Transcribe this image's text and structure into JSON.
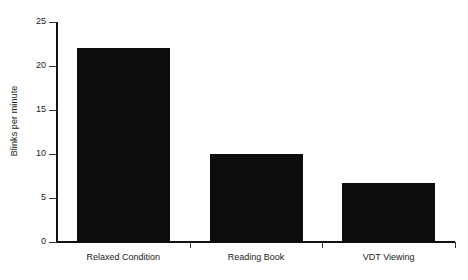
{
  "chart_data": {
    "type": "bar",
    "title": "",
    "xlabel": "",
    "ylabel": "Blinks per minute",
    "categories": [
      "Relaxed Condition",
      "Reading Book",
      "VDT Viewing"
    ],
    "values": [
      22,
      10,
      6.7
    ],
    "ylim": [
      0,
      25
    ],
    "yticks": [
      0,
      5,
      10,
      15,
      20,
      25
    ],
    "ytick_labels": [
      "0",
      "5",
      "10",
      "15",
      "20",
      "25"
    ],
    "grid": false,
    "legend": false,
    "bar_color": "#0d0d0d",
    "axis_color": "#111111",
    "background_color": "#ffffff"
  },
  "axis": {
    "y_title": "Blinks per minute"
  }
}
